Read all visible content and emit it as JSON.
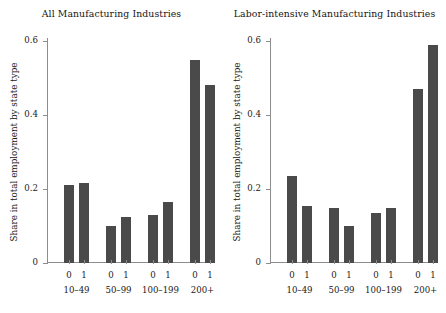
{
  "chart_data": [
    {
      "type": "bar",
      "title": "All Manufacturing Industries",
      "xlabel": "",
      "ylabel": "Share in total employment by state type",
      "ylim": [
        0,
        0.6
      ],
      "yticks": [
        0,
        0.2,
        0.4,
        0.6
      ],
      "ytick_labels": [
        "0",
        "0.2",
        "0.4",
        "0.6"
      ],
      "grid": false,
      "legend": "none",
      "groups": [
        "10–49",
        "50–99",
        "100–199",
        "200+"
      ],
      "subcategories": [
        "0",
        "1"
      ],
      "categories": [
        "10–49 / 0",
        "10–49 / 1",
        "50–99 / 0",
        "50–99 / 1",
        "100–199 / 0",
        "100–199 / 1",
        "200+ / 0",
        "200+ / 1"
      ],
      "values": [
        0.21,
        0.215,
        0.1,
        0.125,
        0.13,
        0.165,
        0.55,
        0.48
      ],
      "bar_color": "#4a4a4a"
    },
    {
      "type": "bar",
      "title": "Labor-intensive Manufacturing Industries",
      "xlabel": "",
      "ylabel": "Share in total employment by state type",
      "ylim": [
        0,
        0.6
      ],
      "yticks": [
        0,
        0.2,
        0.4,
        0.6
      ],
      "ytick_labels": [
        "0",
        "0.2",
        "0.4",
        "0.6"
      ],
      "grid": false,
      "legend": "none",
      "groups": [
        "10–49",
        "50–99",
        "100–199",
        "200+"
      ],
      "subcategories": [
        "0",
        "1"
      ],
      "categories": [
        "10–49 / 0",
        "10–49 / 1",
        "50–99 / 0",
        "50–99 / 1",
        "100–199 / 0",
        "100–199 / 1",
        "200+ / 0",
        "200+ / 1"
      ],
      "values": [
        0.235,
        0.155,
        0.15,
        0.1,
        0.135,
        0.148,
        0.47,
        0.59
      ],
      "bar_color": "#4a4a4a"
    }
  ]
}
